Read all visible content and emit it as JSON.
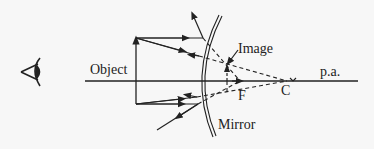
{
  "diagram": {
    "labels": {
      "object": "Object",
      "image": "Image",
      "principal_axis": "p.a.",
      "focus": "F",
      "center": "C",
      "mirror": "Mirror"
    },
    "colors": {
      "line": "#222222",
      "background": "#f7f7f7"
    },
    "icons": {
      "eye": "eye-icon"
    }
  }
}
